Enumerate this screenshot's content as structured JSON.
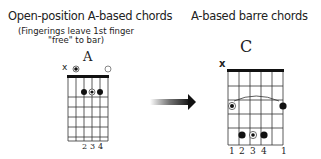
{
  "left": {
    "title": "Open-position A-based chords",
    "subtitle_line1": "(Fingerings leave 1st finger",
    "subtitle_line2": "\"free\" to bar)",
    "chord_name": "A",
    "muted_marker": "x",
    "open_marker": "○",
    "fingers": [
      "2",
      "3",
      "4"
    ]
  },
  "right": {
    "title": "A-based barre chords",
    "chord_name": "C",
    "muted_marker": "x",
    "fingers": [
      "1",
      "2",
      "3",
      "4",
      "1"
    ]
  },
  "arrow": {
    "icon": "right-arrow-icon"
  }
}
